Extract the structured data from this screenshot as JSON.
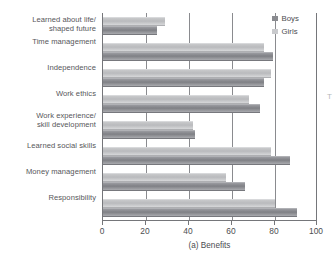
{
  "chart_data": {
    "type": "bar",
    "orientation": "horizontal",
    "title": "",
    "subtitle": "",
    "xlabel": "(a) Benefits",
    "ylabel": "",
    "xlim": [
      0,
      100
    ],
    "xticks": [
      0,
      20,
      40,
      60,
      80,
      100
    ],
    "xticklabels": [
      "0",
      "20",
      "40",
      "60",
      "80",
      "100"
    ],
    "grid": "vertical",
    "legend_position": "top-right",
    "categories": [
      "Learned about life/\nshaped future",
      "Time management",
      "Independence",
      "Work ethics",
      "Work experience/\nskill development",
      "Learned social skills",
      "Money management",
      "Responsibility"
    ],
    "series": [
      {
        "name": "Boys",
        "color": "#87888d",
        "values": [
          25,
          79,
          75,
          73,
          43,
          87,
          66,
          90
        ]
      },
      {
        "name": "Girls",
        "color": "#c6c7ca",
        "values": [
          29,
          75,
          78,
          68,
          42,
          78,
          57,
          80
        ]
      }
    ]
  },
  "legend": {
    "items": [
      {
        "label": "Boys",
        "swatch": "boys-swatch-icon"
      },
      {
        "label": "Girls",
        "swatch": "girls-swatch-icon"
      }
    ]
  },
  "edge_artifact": {
    "text": "T"
  }
}
